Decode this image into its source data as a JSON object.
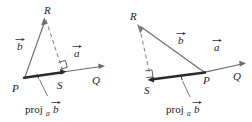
{
  "figure": {
    "colors": {
      "line": "#6b6b6b",
      "thick_line": "#2a2a2a",
      "dashed": "#8a8a8a",
      "text": "#1c1c1c",
      "background": "#ffffff"
    },
    "panels": [
      {
        "id": "left",
        "case": "acute-angle",
        "points": [
          {
            "name": "P",
            "label": "P",
            "x": 20,
            "y": 80
          },
          {
            "name": "R",
            "label": "R",
            "x": 47,
            "y": 12
          },
          {
            "name": "S",
            "label": "S",
            "x": 59,
            "y": 82
          },
          {
            "name": "Q",
            "label": "Q",
            "x": 97,
            "y": 83
          }
        ],
        "vectors": [
          {
            "name": "b",
            "label": "b",
            "accent": "arrow",
            "x": 18,
            "y": 44
          },
          {
            "name": "a",
            "label": "a",
            "accent": "arrow",
            "x": 75,
            "y": 51
          }
        ],
        "projection_label": {
          "text": "proj",
          "subscript": "a",
          "variable": "b",
          "accent": "arrow",
          "x": 28,
          "y": 110
        },
        "right_angle_at": "S",
        "dashed_segment": "R to S",
        "thick_segment": "P to S"
      },
      {
        "id": "right",
        "case": "obtuse-angle",
        "points": [
          {
            "name": "R",
            "label": "R",
            "x": 133,
            "y": 17
          },
          {
            "name": "S",
            "label": "S",
            "x": 148,
            "y": 87
          },
          {
            "name": "P",
            "label": "P",
            "x": 206,
            "y": 80
          },
          {
            "name": "Q",
            "label": "Q",
            "x": 237,
            "y": 79
          }
        ],
        "vectors": [
          {
            "name": "b",
            "label": "b",
            "accent": "arrow",
            "x": 179,
            "y": 38
          },
          {
            "name": "a",
            "label": "a",
            "accent": "arrow",
            "x": 215,
            "y": 45
          }
        ],
        "projection_label": {
          "text": "proj",
          "subscript": "a",
          "variable": "b",
          "accent": "arrow",
          "x": 168,
          "y": 110
        },
        "right_angle_at": "S",
        "dashed_segment": "R to S",
        "thick_segment": "S to P"
      }
    ]
  }
}
